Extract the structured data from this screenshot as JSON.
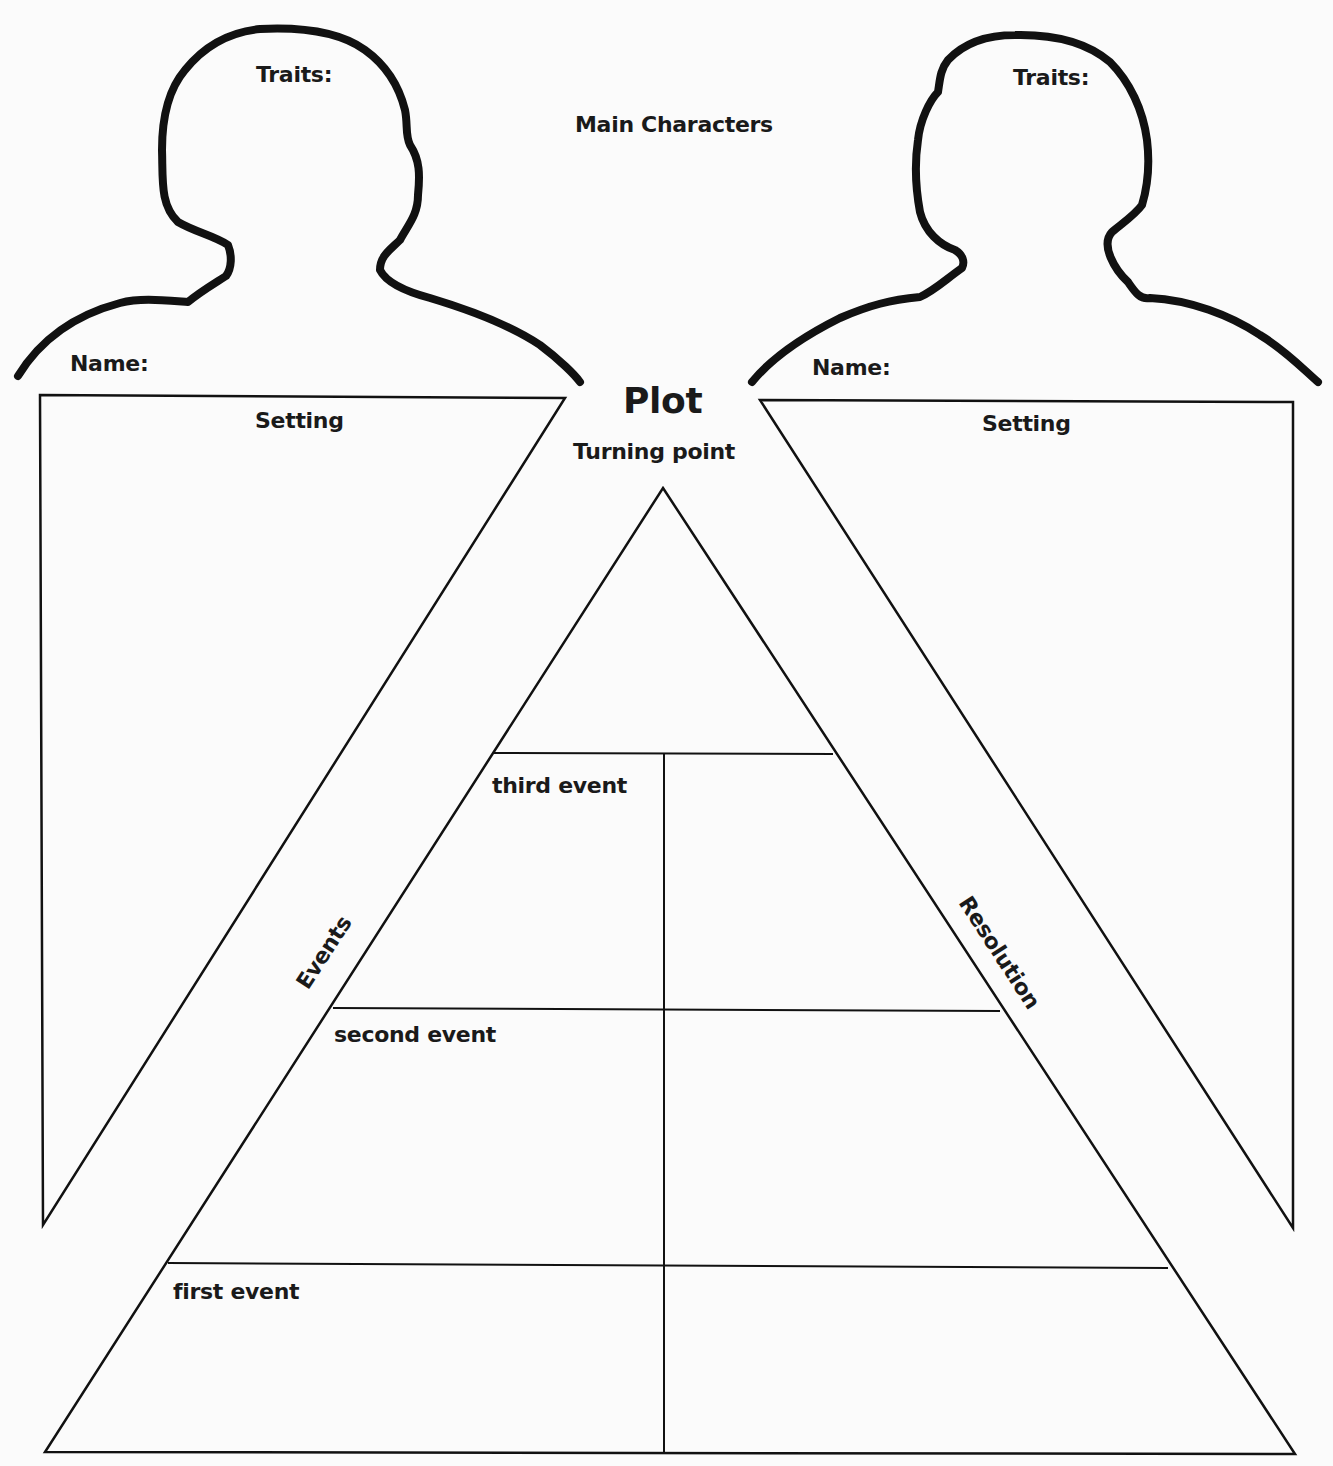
{
  "worksheet": {
    "title": "Main Characters",
    "characters": [
      {
        "traits_label": "Traits:",
        "name_label": "Name:"
      },
      {
        "traits_label": "Traits:",
        "name_label": "Name:"
      }
    ],
    "settings": [
      {
        "label": "Setting"
      },
      {
        "label": "Setting"
      }
    ],
    "plot": {
      "title": "Plot",
      "turning_point_label": "Turning point",
      "events_label": "Events",
      "resolution_label": "Resolution",
      "event_rows": [
        {
          "label": "third event"
        },
        {
          "label": "second event"
        },
        {
          "label": "first event"
        }
      ]
    }
  },
  "colors": {
    "ink": "#1a1a1a",
    "paper": "#fbfbfb"
  }
}
